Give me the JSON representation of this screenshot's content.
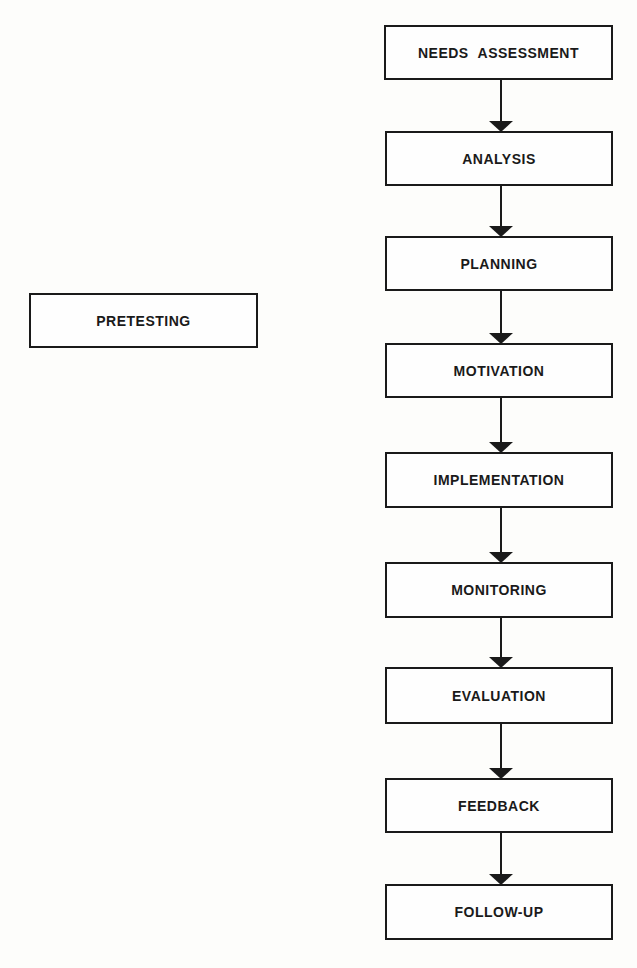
{
  "diagram": {
    "type": "flowchart",
    "side_box": {
      "label": "PRETESTING"
    },
    "steps": [
      {
        "label": "NEEDS ASSESSMENT"
      },
      {
        "label": "ANALYSIS"
      },
      {
        "label": "PLANNING"
      },
      {
        "label": "MOTIVATION"
      },
      {
        "label": "IMPLEMENTATION"
      },
      {
        "label": "MONITORING"
      },
      {
        "label": "EVALUATION"
      },
      {
        "label": "FEEDBACK"
      },
      {
        "label": "FOLLOW-UP"
      }
    ],
    "colors": {
      "line": "#1a1a1a",
      "background": "#fdfdfb"
    }
  }
}
